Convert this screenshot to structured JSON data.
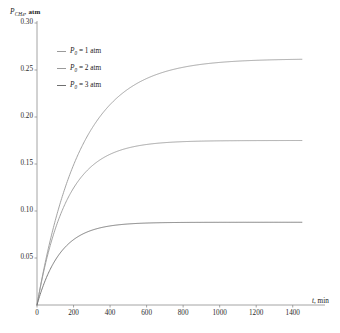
{
  "chart_data": {
    "type": "line",
    "title": "",
    "xlabel": "t, min",
    "ylabel": "P_CH4, atm",
    "ylabel_symbol": "P",
    "ylabel_subscript": "CH",
    "ylabel_subscript2": "4",
    "ylabel_unit": "atm",
    "xlabel_symbol": "t",
    "xlabel_unit": "min",
    "xlim": [
      0,
      1500
    ],
    "ylim": [
      0,
      0.3
    ],
    "xticks": [
      0,
      200,
      400,
      600,
      800,
      1000,
      1200,
      1400
    ],
    "xtick_labels": [
      "0",
      "200",
      "400",
      "600",
      "800",
      "1000",
      "1200",
      "1400"
    ],
    "yticks": [
      0.05,
      0.1,
      0.15,
      0.2,
      0.25,
      0.3
    ],
    "ytick_labels": [
      "0.05",
      "0.10",
      "0.15",
      "0.20",
      "0.25",
      "0.30"
    ],
    "grid": false,
    "legend_position": "upper-left-inside",
    "x_max_data": 1450,
    "series": [
      {
        "name": "P0 = 1 atm",
        "label_symbol": "P",
        "label_subscript": "0",
        "label_value": "1",
        "label_unit": "atm",
        "color": "#9a9a9a",
        "plateau": 0.262,
        "rate_constant": 0.0042,
        "x": [
          0,
          25,
          50,
          75,
          100,
          150,
          200,
          250,
          300,
          350,
          400,
          450,
          500,
          600,
          700,
          800,
          900,
          1000,
          1100,
          1200,
          1300,
          1400,
          1450
        ],
        "y": [
          0.0,
          0.0261,
          0.0495,
          0.0705,
          0.0894,
          0.1218,
          0.1479,
          0.1689,
          0.1857,
          0.1993,
          0.2102,
          0.219,
          0.226,
          0.2362,
          0.2429,
          0.2473,
          0.2502,
          0.2521,
          0.2533,
          0.2541,
          0.2546,
          0.255,
          0.2551
        ]
      },
      {
        "name": "P0 = 2 atm",
        "label_symbol": "P",
        "label_subscript": "0",
        "label_value": "2",
        "label_unit": "atm",
        "color": "#9a9a9a",
        "plateau": 0.175,
        "rate_constant": 0.0062,
        "x": [
          0,
          25,
          50,
          75,
          100,
          150,
          200,
          250,
          300,
          350,
          400,
          450,
          500,
          600,
          700,
          800,
          900,
          1000,
          1100,
          1200,
          1300,
          1400,
          1450
        ],
        "y": [
          0.0,
          0.025,
          0.0464,
          0.0648,
          0.0806,
          0.1059,
          0.1246,
          0.1385,
          0.1488,
          0.1564,
          0.1621,
          0.1663,
          0.1694,
          0.1734,
          0.1755,
          0.1766,
          0.1772,
          0.1776,
          0.1778,
          0.1779,
          0.178,
          0.178,
          0.178
        ]
      },
      {
        "name": "P0 = 3 atm",
        "label_symbol": "P",
        "label_subscript": "0",
        "label_value": "3",
        "label_unit": "atm",
        "color": "#6f6f6f",
        "plateau": 0.088,
        "rate_constant": 0.0078,
        "x": [
          0,
          25,
          50,
          75,
          100,
          150,
          200,
          250,
          300,
          350,
          400,
          450,
          500,
          600,
          700,
          800,
          900,
          1000,
          1100,
          1200,
          1300,
          1400,
          1450
        ],
        "y": [
          0.0,
          0.0152,
          0.0277,
          0.038,
          0.0464,
          0.059,
          0.0675,
          0.0732,
          0.077,
          0.0796,
          0.0814,
          0.0825,
          0.0833,
          0.0842,
          0.0846,
          0.0848,
          0.0849,
          0.0849,
          0.085,
          0.085,
          0.085,
          0.085,
          0.085
        ]
      }
    ]
  },
  "axes": {
    "axis_color": "#8d8d8d"
  }
}
